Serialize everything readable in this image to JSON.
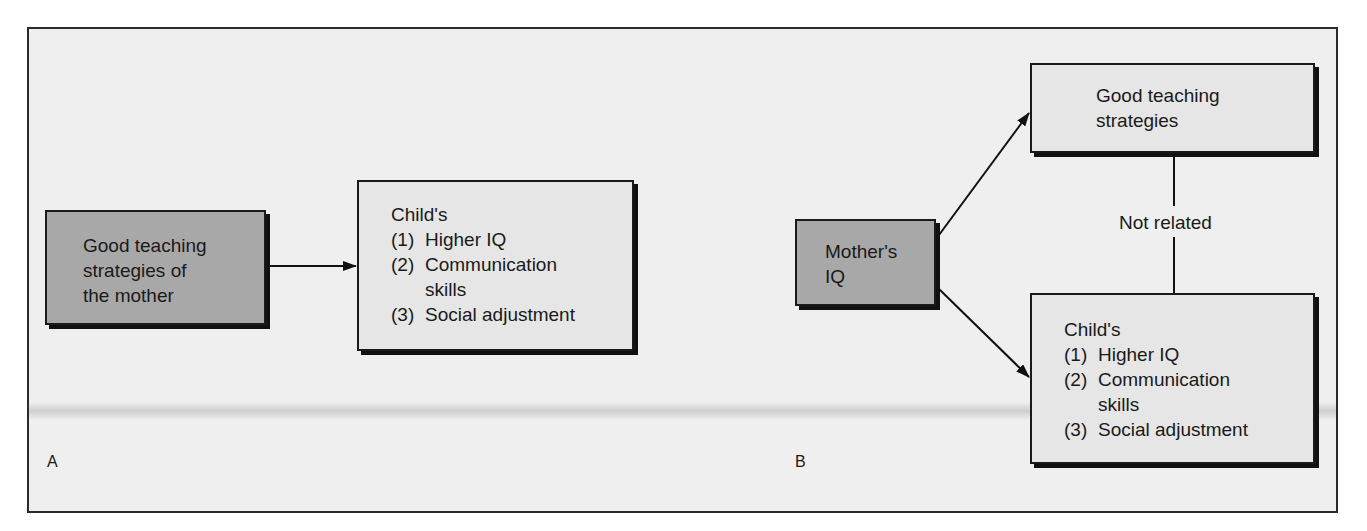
{
  "panels": {
    "A": {
      "letter": "A",
      "cause_box": {
        "lines": [
          "Good teaching",
          "strategies of",
          "the mother"
        ]
      },
      "effect_box": {
        "heading": "Child's",
        "items": [
          {
            "num": "(1)",
            "text": "Higher IQ"
          },
          {
            "num": "(2)",
            "text": "Communication",
            "continuation": "skills"
          },
          {
            "num": "(3)",
            "text": "Social adjustment"
          }
        ]
      }
    },
    "B": {
      "letter": "B",
      "source_box": {
        "lines": [
          "Mother's",
          "IQ"
        ]
      },
      "top_box": {
        "lines": [
          "Good teaching",
          "strategies"
        ]
      },
      "connector_label": "Not related",
      "bottom_box": {
        "heading": "Child's",
        "items": [
          {
            "num": "(1)",
            "text": "Higher IQ"
          },
          {
            "num": "(2)",
            "text": "Communication",
            "continuation": "skills"
          },
          {
            "num": "(3)",
            "text": "Social adjustment"
          }
        ]
      }
    }
  },
  "colors": {
    "dark_box_fill": "#a8a8a8",
    "light_box_fill": "#e6e6e6",
    "background": "#efefef",
    "stroke": "#1a1a1a"
  }
}
